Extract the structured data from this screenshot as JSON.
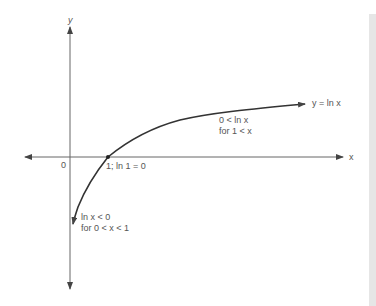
{
  "diagram": {
    "axes": {
      "x_label": "x",
      "y_label": "y",
      "origin_label": "0"
    },
    "curve": {
      "label": "y = ln x",
      "color": "#333333"
    },
    "annotations": {
      "intercept": "1; ln 1 = 0",
      "positive_region_line1": "0 < ln x",
      "positive_region_line2": "for 1 < x",
      "negative_region_line1": "ln x < 0",
      "negative_region_line2": "for 0 < x < 1"
    },
    "colors": {
      "axis": "#555555",
      "curve": "#333333",
      "text": "#555555",
      "side_strip": "#e6e6e6"
    }
  }
}
